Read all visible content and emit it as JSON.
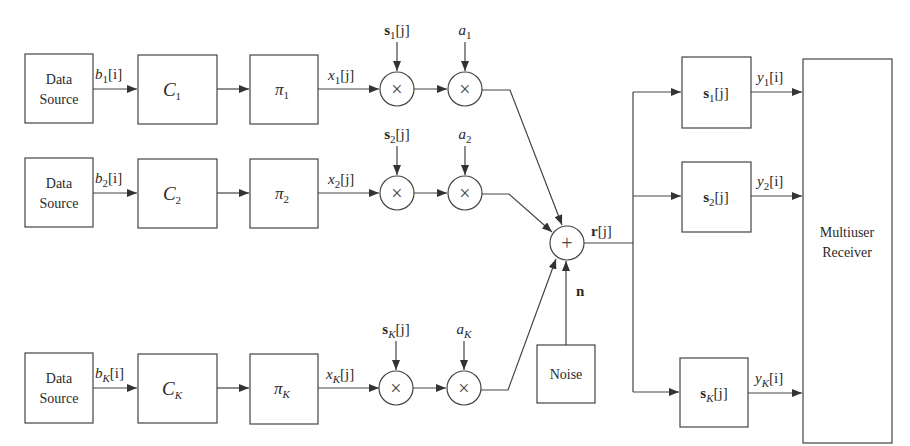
{
  "diagram": {
    "type": "block-diagram",
    "title": "",
    "users": [
      {
        "row": "1",
        "source_label_line1": "Data",
        "source_label_line2": "Source",
        "bit_signal": {
          "base": "b",
          "sub": "1",
          "idx": "[i]"
        },
        "encoder": {
          "base": "C",
          "sub": "1"
        },
        "interleaver": {
          "base": "π",
          "sub": "1"
        },
        "chip_signal": {
          "base": "x",
          "sub": "1",
          "idx": "[j]"
        },
        "spreading_seq": {
          "base": "s",
          "sub": "1",
          "idx": "[j]"
        },
        "amplitude": {
          "base": "a",
          "sub": "1"
        },
        "despreader": {
          "base": "s",
          "sub": "1",
          "idx": "[j]"
        },
        "output": {
          "base": "y",
          "sub": "1",
          "idx": "[i]"
        }
      },
      {
        "row": "2",
        "source_label_line1": "Data",
        "source_label_line2": "Source",
        "bit_signal": {
          "base": "b",
          "sub": "2",
          "idx": "[i]"
        },
        "encoder": {
          "base": "C",
          "sub": "2"
        },
        "interleaver": {
          "base": "π",
          "sub": "2"
        },
        "chip_signal": {
          "base": "x",
          "sub": "2",
          "idx": "[j]"
        },
        "spreading_seq": {
          "base": "s",
          "sub": "2",
          "idx": "[j]"
        },
        "amplitude": {
          "base": "a",
          "sub": "2"
        },
        "despreader": {
          "base": "s",
          "sub": "2",
          "idx": "[j]"
        },
        "output": {
          "base": "y",
          "sub": "2",
          "idx": "[i]"
        }
      },
      {
        "row": "K",
        "source_label_line1": "Data",
        "source_label_line2": "Source",
        "bit_signal": {
          "base": "b",
          "sub": "K",
          "idx": "[i]"
        },
        "encoder": {
          "base": "C",
          "sub": "K"
        },
        "interleaver": {
          "base": "π",
          "sub": "K"
        },
        "chip_signal": {
          "base": "x",
          "sub": "K",
          "idx": "[j]"
        },
        "spreading_seq": {
          "base": "s",
          "sub": "K",
          "idx": "[j]"
        },
        "amplitude": {
          "base": "a",
          "sub": "K"
        },
        "despreader": {
          "base": "s",
          "sub": "K",
          "idx": "[j]"
        },
        "output": {
          "base": "y",
          "sub": "K",
          "idx": "[i]"
        }
      }
    ],
    "multiply_symbol": "×",
    "sum_symbol": "+",
    "received_signal": {
      "base": "r",
      "idx": "[j]"
    },
    "noise_signal": "n",
    "noise_box": "Noise",
    "receiver_line1": "Multiuser",
    "receiver_line2": "Receiver"
  }
}
